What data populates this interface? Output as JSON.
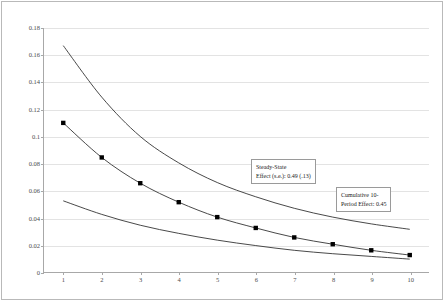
{
  "chart_data": {
    "type": "line",
    "title": "",
    "xlabel": "",
    "ylabel": "",
    "x": [
      1,
      2,
      3,
      4,
      5,
      6,
      7,
      8,
      9,
      10
    ],
    "xlim": [
      0.5,
      10.5
    ],
    "ylim": [
      0,
      0.18
    ],
    "grid": true,
    "legend_position": "none",
    "y_tick_labels": [
      "0",
      "0.02",
      "0.04",
      "0.06",
      "0.08",
      "0.1",
      "0.12",
      "0.14",
      "0.16",
      "0.18"
    ],
    "y_tick_values": [
      0,
      0.02,
      0.04,
      0.06,
      0.08,
      0.1,
      0.12,
      0.14,
      0.16,
      0.18
    ],
    "x_tick_labels": [
      "1",
      "2",
      "3",
      "4",
      "5",
      "6",
      "7",
      "8",
      "9",
      "10"
    ],
    "series": [
      {
        "name": "upper-confidence-band",
        "markers": false,
        "values": [
          0.167,
          0.129,
          0.1,
          0.0805,
          0.066,
          0.0555,
          0.047,
          0.0405,
          0.0355,
          0.0315
        ]
      },
      {
        "name": "point-estimate",
        "markers": true,
        "values": [
          0.11,
          0.0845,
          0.0655,
          0.0515,
          0.0405,
          0.0325,
          0.0255,
          0.0205,
          0.016,
          0.0125
        ]
      },
      {
        "name": "lower-confidence-band",
        "markers": false,
        "values": [
          0.0525,
          0.0425,
          0.0345,
          0.0285,
          0.0235,
          0.0195,
          0.016,
          0.0135,
          0.0115,
          0.0095
        ]
      }
    ],
    "annotations": [
      {
        "name": "steady-state-effect",
        "lines": [
          "Steady-State",
          "Effect (s.e.): 0.49 (.13)"
        ]
      },
      {
        "name": "cumulative-effect",
        "lines": [
          "Cumulative 10-",
          "Period Effect: 0.45"
        ]
      }
    ],
    "colors": {
      "curve": "#333333",
      "marker": "#000000",
      "grid": "#e3e3e3",
      "axis": "#a8a8a8",
      "frame": "#b9b9b9",
      "text": "#4c4c4c",
      "background": "#ffffff"
    }
  }
}
